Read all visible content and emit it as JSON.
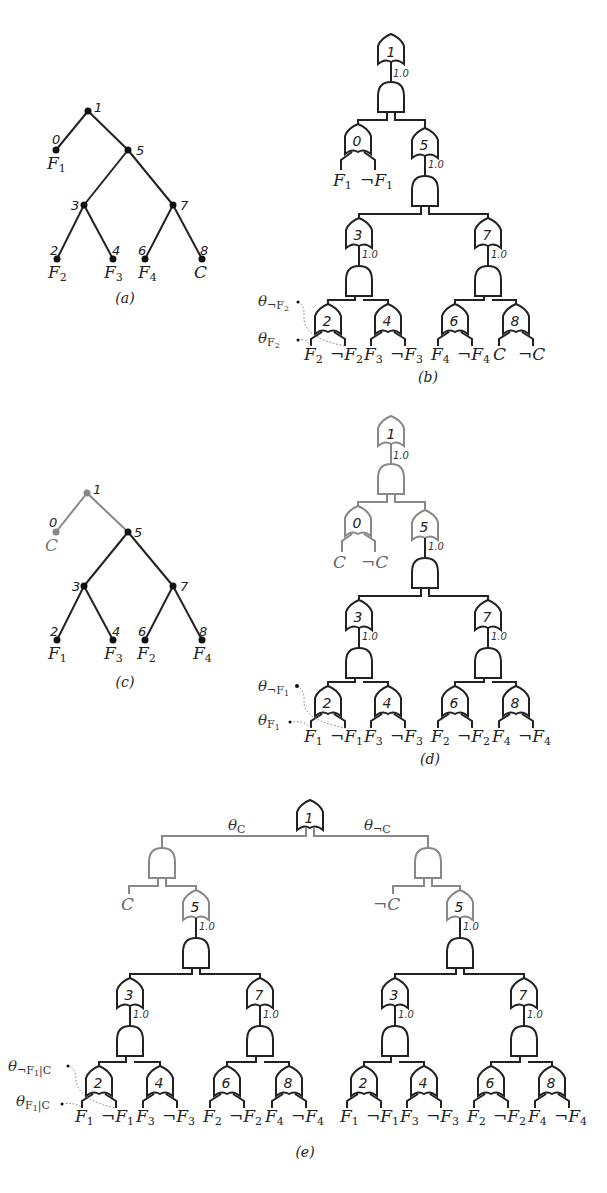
{
  "figure": {
    "panels": {
      "a": {
        "caption": "(a)",
        "type": "vtree",
        "nodes": [
          {
            "id": "1",
            "label": "1"
          },
          {
            "id": "0",
            "label": "0",
            "leaf": "F1"
          },
          {
            "id": "5",
            "label": "5"
          },
          {
            "id": "3",
            "label": "3"
          },
          {
            "id": "7",
            "label": "7"
          },
          {
            "id": "2",
            "label": "2",
            "leaf": "F2"
          },
          {
            "id": "4",
            "label": "4",
            "leaf": "F3"
          },
          {
            "id": "6",
            "label": "6",
            "leaf": "F4"
          },
          {
            "id": "8",
            "label": "8",
            "leaf": "C"
          }
        ]
      },
      "b": {
        "caption": "(b)",
        "type": "sdd-circuit",
        "weight_label": "1.0",
        "gates": [
          "1",
          "0",
          "5",
          "3",
          "7",
          "2",
          "4",
          "6",
          "8"
        ],
        "literals": [
          "F1",
          "¬F1",
          "F2",
          "¬F2",
          "F3",
          "¬F3",
          "F4",
          "¬F4",
          "C",
          "¬C"
        ],
        "annotations": [
          "θ¬F2",
          "θF2"
        ]
      },
      "c": {
        "caption": "(c)",
        "type": "vtree",
        "highlight_color": "#888888",
        "nodes": [
          {
            "id": "1",
            "label": "1",
            "gray": true
          },
          {
            "id": "0",
            "label": "0",
            "leaf": "C",
            "gray": true
          },
          {
            "id": "5",
            "label": "5"
          },
          {
            "id": "3",
            "label": "3"
          },
          {
            "id": "7",
            "label": "7"
          },
          {
            "id": "2",
            "label": "2",
            "leaf": "F1"
          },
          {
            "id": "4",
            "label": "4",
            "leaf": "F3"
          },
          {
            "id": "6",
            "label": "6",
            "leaf": "F2"
          },
          {
            "id": "8",
            "label": "8",
            "leaf": "F4"
          }
        ]
      },
      "d": {
        "caption": "(d)",
        "type": "sdd-circuit",
        "weight_label": "1.0",
        "gates": [
          "1",
          "0",
          "5",
          "3",
          "7",
          "2",
          "4",
          "6",
          "8"
        ],
        "literals": [
          "C",
          "¬C",
          "F1",
          "¬F1",
          "F3",
          "¬F3",
          "F2",
          "¬F2",
          "F4",
          "¬F4"
        ],
        "annotations": [
          "θ¬F1",
          "θF1"
        ]
      },
      "e": {
        "caption": "(e)",
        "type": "sdd-circuit",
        "weight_label": "1.0",
        "root_weights": [
          "θC",
          "θ¬C"
        ],
        "top_literals": [
          "C",
          "¬C"
        ],
        "gates": [
          "1",
          "5",
          "3",
          "7",
          "2",
          "4",
          "6",
          "8"
        ],
        "literals": [
          "F1",
          "¬F1",
          "F3",
          "¬F3",
          "F2",
          "¬F2",
          "F4",
          "¬F4"
        ],
        "annotations": [
          "θ¬F1|C",
          "θF1|C"
        ]
      }
    },
    "labels": {
      "w": "1.0",
      "n0": "0",
      "n1": "1",
      "n2": "2",
      "n3": "3",
      "n4": "4",
      "n5": "5",
      "n6": "6",
      "n7": "7",
      "n8": "8",
      "cap_a": "(a)",
      "cap_b": "(b)",
      "cap_c": "(c)",
      "cap_d": "(d)",
      "cap_e": "(e)",
      "F": "F",
      "C": "C",
      "neg": "¬",
      "theta": "θ",
      "s1": "1",
      "s2": "2",
      "s3": "3",
      "s4": "4",
      "sub_negF2": "¬F",
      "sub_negF1": "¬F",
      "sub_C": "C",
      "sub_negC": "¬C",
      "sub_negF1C_a": "¬F",
      "sub_F1C_a": "F",
      "bar_C": "|C"
    }
  }
}
